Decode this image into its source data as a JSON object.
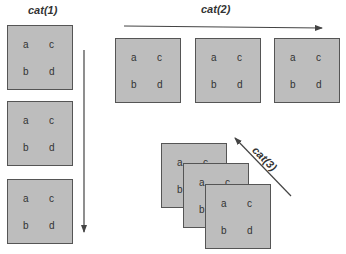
{
  "labels": {
    "cat1": "cat(1)",
    "cat2": "cat(2)",
    "cat3": "cat(3)"
  },
  "cells": {
    "a": "a",
    "b": "b",
    "c": "c",
    "d": "d"
  },
  "colors": {
    "box_fill": "#bdbdbd",
    "box_border": "#555555",
    "arrow": "#444444",
    "text": "#333333"
  }
}
